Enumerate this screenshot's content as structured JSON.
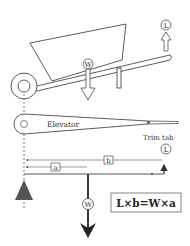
{
  "diagram": {
    "labels": {
      "weight_symbol": "W",
      "lift_symbol": "L",
      "elevator": "Elevator",
      "trim_tab": "Trim tab",
      "distance_a": "a",
      "distance_b": "b",
      "formula": "L×b=W×a"
    },
    "colors": {
      "line": "#333333",
      "fulcrum": "#555555",
      "background": "#ffffff"
    }
  }
}
